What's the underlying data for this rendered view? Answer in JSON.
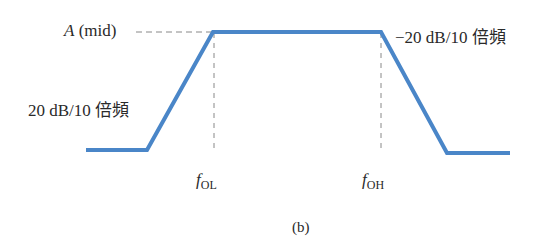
{
  "diagram": {
    "type": "frequency-response-asymptotic",
    "caption": "(b)",
    "labels": {
      "mid_gain_var": "A",
      "mid_gain_suffix": " (mid)",
      "rise_slope": "20 dB/10 倍頻",
      "fall_slope": "−20 dB/10 倍頻",
      "f_low_var": "f",
      "f_low_sub": "OL",
      "f_high_var": "f",
      "f_high_sub": "OH"
    },
    "curve_color": "#4a86c8",
    "guide_color": "#888888",
    "curve_points": [
      [
        86,
        150
      ],
      [
        147,
        150
      ],
      [
        213,
        32
      ],
      [
        381,
        32
      ],
      [
        447,
        153
      ],
      [
        510,
        153
      ]
    ]
  }
}
